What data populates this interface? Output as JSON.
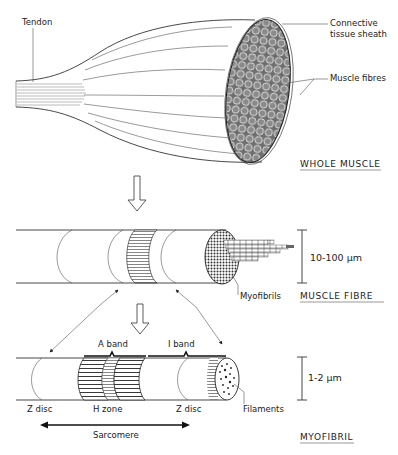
{
  "diagram": {
    "levels": [
      {
        "title": "WHOLE MUSCLE",
        "labels": {
          "tendon": "Tendon",
          "sheath_line1": "Connective",
          "sheath_line2": "tissue sheath",
          "fibres": "Muscle fibres"
        }
      },
      {
        "title": "MUSCLE FIBRE",
        "scale": "10-100 µm",
        "labels": {
          "myofibrils": "Myofibrils"
        }
      },
      {
        "title": "MYOFIBRIL",
        "scale": "1-2 µm",
        "labels": {
          "a_band": "A band",
          "i_band": "I band",
          "z_disc_left": "Z disc",
          "h_zone": "H zone",
          "z_disc_right": "Z disc",
          "filaments": "Filaments",
          "sarcomere": "Sarcomere"
        }
      }
    ],
    "colors": {
      "line": "#333333",
      "fill_texture": "#7a7a7a",
      "background": "#ffffff"
    }
  }
}
